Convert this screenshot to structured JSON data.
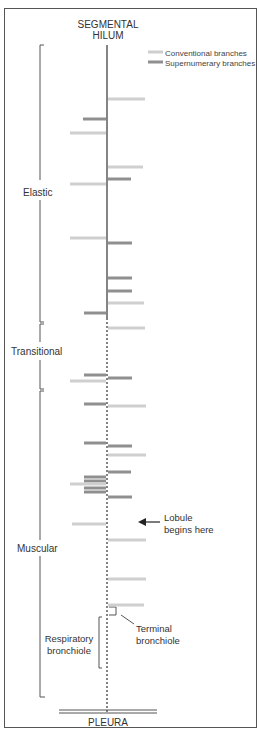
{
  "title": {
    "line1": "SEGMENTAL",
    "line2": "HILUM"
  },
  "bottom_label": "PLEURA",
  "legend": {
    "conventional": {
      "label": "Conventional branches",
      "color": "#cfcfcf"
    },
    "supernumerary": {
      "label": "Supernumerary branches",
      "color": "#8f8f8f"
    }
  },
  "zones": {
    "elastic": "Elastic",
    "transitional": "Transitional",
    "muscular": "Muscular",
    "respiratory_line1": "Respiratory",
    "respiratory_line2": "bronchiole"
  },
  "annotations": {
    "lobule_line1": "Lobule",
    "lobule_line2": "begins here",
    "terminal_line1": "Terminal",
    "terminal_line2": "bronchiole"
  },
  "branches": {
    "right": [
      {
        "y": 99,
        "type": "conventional",
        "x2": 145
      },
      {
        "y": 167,
        "type": "conventional",
        "x2": 143
      },
      {
        "y": 179,
        "type": "supernumerary",
        "x2": 131
      },
      {
        "y": 243,
        "type": "supernumerary",
        "x2": 132
      },
      {
        "y": 278,
        "type": "supernumerary",
        "x2": 132
      },
      {
        "y": 291,
        "type": "supernumerary",
        "x2": 132
      },
      {
        "y": 303,
        "type": "conventional",
        "x2": 144
      },
      {
        "y": 328,
        "type": "conventional",
        "x2": 145
      },
      {
        "y": 378,
        "type": "supernumerary",
        "x2": 132
      },
      {
        "y": 406,
        "type": "conventional",
        "x2": 146
      },
      {
        "y": 446,
        "type": "supernumerary",
        "x2": 132
      },
      {
        "y": 455,
        "type": "conventional",
        "x2": 146
      },
      {
        "y": 472,
        "type": "supernumerary",
        "x2": 131
      },
      {
        "y": 497,
        "type": "supernumerary",
        "x2": 132
      },
      {
        "y": 540,
        "type": "conventional",
        "x2": 146
      },
      {
        "y": 579,
        "type": "conventional",
        "x2": 146
      },
      {
        "y": 605,
        "type": "conventional",
        "x2": 144
      }
    ],
    "left": [
      {
        "y": 119,
        "type": "supernumerary",
        "x1": 83
      },
      {
        "y": 133,
        "type": "conventional",
        "x1": 70
      },
      {
        "y": 184,
        "type": "conventional",
        "x1": 70
      },
      {
        "y": 238,
        "type": "conventional",
        "x1": 70
      },
      {
        "y": 313,
        "type": "supernumerary",
        "x1": 84
      },
      {
        "y": 375,
        "type": "supernumerary",
        "x1": 84
      },
      {
        "y": 381,
        "type": "conventional",
        "x1": 70
      },
      {
        "y": 404,
        "type": "supernumerary",
        "x1": 84
      },
      {
        "y": 443,
        "type": "supernumerary",
        "x1": 84
      },
      {
        "y": 477,
        "type": "supernumerary",
        "x1": 84
      },
      {
        "y": 481,
        "type": "supernumerary",
        "x1": 84
      },
      {
        "y": 484,
        "type": "conventional",
        "x1": 70
      },
      {
        "y": 488,
        "type": "supernumerary",
        "x1": 84
      },
      {
        "y": 492,
        "type": "supernumerary",
        "x1": 84
      },
      {
        "y": 524,
        "type": "conventional",
        "x1": 72
      }
    ]
  }
}
